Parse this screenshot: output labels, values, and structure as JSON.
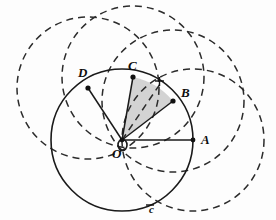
{
  "figure": {
    "label_c": "c",
    "points": [
      {
        "id": "A",
        "label": "A",
        "x": 193,
        "y": 140,
        "lx": 201,
        "ly": 144
      },
      {
        "id": "B",
        "label": "B",
        "x": 173,
        "y": 101,
        "lx": 181,
        "ly": 97
      },
      {
        "id": "C",
        "label": "C",
        "x": 133,
        "y": 77,
        "lx": 130,
        "ly": 70
      },
      {
        "id": "D",
        "label": "D",
        "x": 88,
        "y": 88,
        "lx": 80,
        "ly": 77
      },
      {
        "id": "O",
        "label": "O",
        "x": 122,
        "y": 140,
        "lx": 115,
        "ly": 155
      }
    ],
    "center": {
      "x": 122,
      "y": 140
    },
    "radius": 71,
    "main_circle_label_pos": {
      "x": 152,
      "y": 212
    },
    "dashed_circle_centers": [
      "A",
      "B",
      "C",
      "D"
    ],
    "shaded_sector": {
      "from": "C",
      "to": "B",
      "apex": "O"
    },
    "interior_dashed_chord": {
      "from": "O",
      "to": "B"
    },
    "colors": {
      "stroke": "#1a1a1a",
      "dashed": "#2b2b2b",
      "shade": "#b9b9b9",
      "background": "#fdfdfd"
    }
  }
}
